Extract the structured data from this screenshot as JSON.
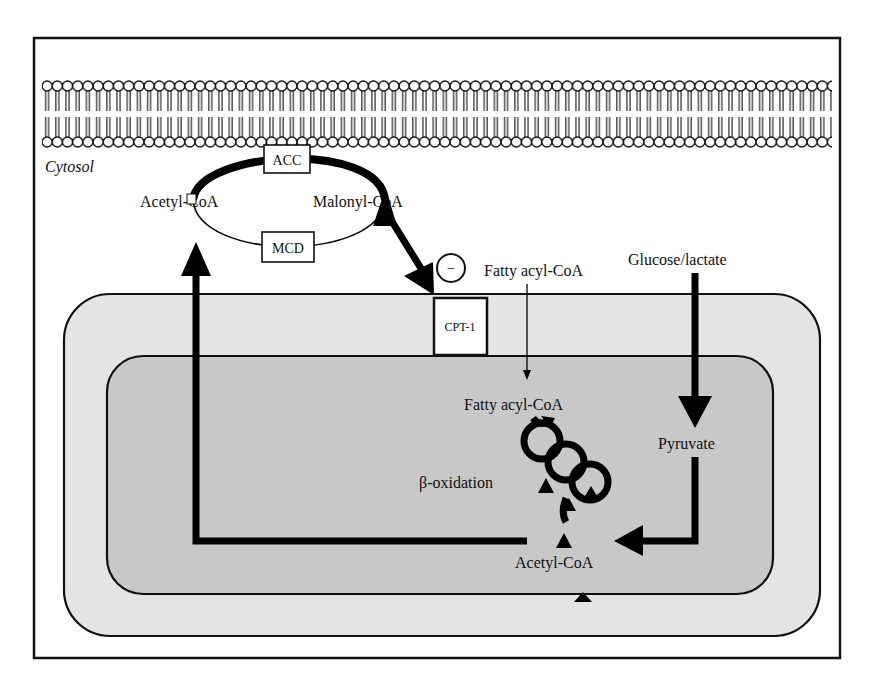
{
  "diagram": {
    "compartments": {
      "cytosol_label": "Cytosol"
    },
    "enzymes": {
      "acc": "ACC",
      "mcd": "MCD",
      "cpt1": "CPT-1"
    },
    "metabolites": {
      "acetyl_coa_cytosol": "Acetyl-CoA",
      "malonyl_coa": "Malonyl-CoA",
      "fatty_acyl_coa_cytosol": "Fatty acyl-CoA",
      "glucose_lactate": "Glucose/lactate",
      "fatty_acyl_coa_mito": "Fatty acyl-CoA",
      "pyruvate": "Pyruvate",
      "acetyl_coa_mito": "Acetyl-CoA"
    },
    "processes": {
      "beta_oxidation": "β-oxidation"
    },
    "inhibition_symbol": "−",
    "colors": {
      "frame": "#111111",
      "outer_mito": "#e4e4e4",
      "inner_mito": "#c8c8c8",
      "arrow": "#000000"
    }
  }
}
